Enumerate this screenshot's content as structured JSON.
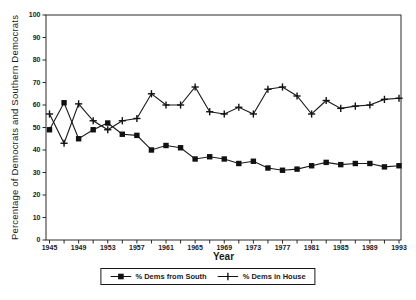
{
  "chart_data": {
    "type": "line",
    "title": "",
    "xlabel": "Year",
    "ylabel": "Percentage of Democrats and Southern Democrats",
    "x": [
      1945,
      1947,
      1949,
      1951,
      1953,
      1955,
      1957,
      1959,
      1961,
      1963,
      1965,
      1967,
      1969,
      1971,
      1973,
      1975,
      1977,
      1979,
      1981,
      1983,
      1985,
      1987,
      1989,
      1991,
      1993
    ],
    "series": [
      {
        "name": "% Dems from South",
        "marker": "square",
        "values": [
          49,
          61,
          45,
          49,
          52,
          47,
          46.5,
          40,
          42,
          41,
          36,
          37,
          36,
          34,
          35,
          32,
          31,
          31.5,
          33,
          34.5,
          33.5,
          34,
          34,
          32.5,
          33
        ]
      },
      {
        "name": "% Dems in House",
        "marker": "plus",
        "values": [
          56,
          43,
          60.5,
          53,
          49,
          53,
          54,
          65,
          60,
          60,
          68,
          57,
          56,
          59,
          56,
          67,
          68,
          64,
          56,
          62,
          58.5,
          59.5,
          60,
          62.5,
          63
        ]
      }
    ],
    "xlim": [
      1945,
      1993
    ],
    "ylim": [
      0,
      100
    ],
    "y_ticks": [
      0,
      10,
      20,
      30,
      40,
      50,
      60,
      70,
      80,
      90,
      100
    ],
    "x_tick_labels": [
      1945,
      1949,
      1953,
      1957,
      1961,
      1965,
      1969,
      1973,
      1977,
      1981,
      1985,
      1989,
      1993
    ],
    "x_minor_tick_step": 2,
    "grid": false,
    "legend_position": "bottom-center"
  },
  "colors": {
    "line": "#1a1a1a",
    "marker": "#111111",
    "frame": "#2b2b2b",
    "text": "#1a1a1a",
    "background": "#ffffff"
  }
}
